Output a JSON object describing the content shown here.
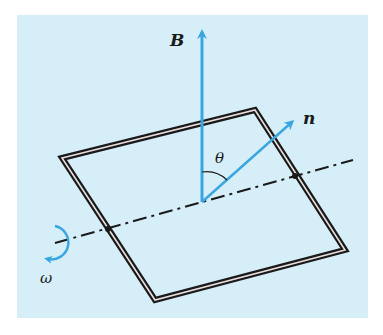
{
  "diagram": {
    "labels": {
      "field": "B",
      "normal": "n",
      "angle": "θ",
      "angular_velocity": "ω"
    },
    "colors": {
      "background_panel": "#d6eef8",
      "vector": "#3aa6e0",
      "coil": "#1a1a1a",
      "axis": "#1a1a1a"
    }
  }
}
